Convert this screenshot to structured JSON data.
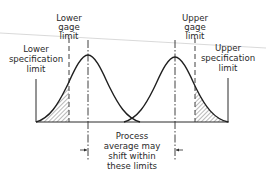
{
  "diagram": {
    "labels": {
      "lower_gage": [
        "Lower",
        "gage",
        "limit"
      ],
      "upper_gage": [
        "Upper",
        "gage",
        "limit"
      ],
      "lower_spec": [
        "Lower",
        "specification",
        "limit"
      ],
      "upper_spec": [
        "Upper",
        "specification",
        "limit"
      ],
      "process_note": [
        "Process",
        "average may",
        "shift within",
        "these limits"
      ]
    },
    "elements": {
      "curves": [
        "left-normal-curve",
        "right-normal-curve"
      ],
      "hatched_regions": [
        "left-tail-between-spec-and-gage",
        "right-tail-between-gage-and-spec"
      ],
      "lines": [
        "lower-spec-limit-line",
        "lower-gage-limit-line",
        "left-mean-line",
        "right-mean-line",
        "upper-gage-limit-line",
        "upper-spec-limit-line",
        "baseline"
      ]
    },
    "colors": {
      "ink": "#2a2a2a",
      "faint_line": "#cfcfcf",
      "background": "#ffffff"
    }
  }
}
